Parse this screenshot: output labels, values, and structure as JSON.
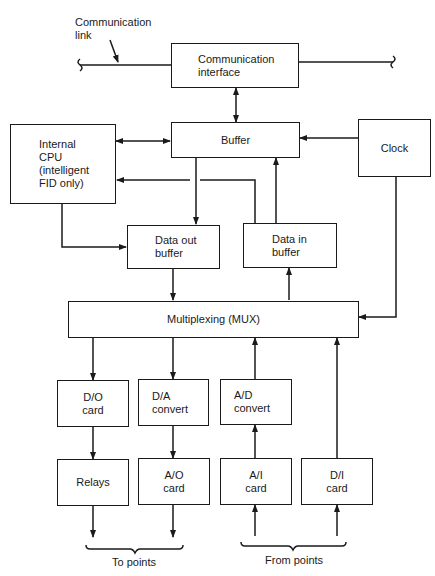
{
  "labels": {
    "communication_link": [
      "Communication",
      "link"
    ],
    "to_points": "To points",
    "from_points": "From points"
  },
  "blocks": {
    "comm_interface": [
      "Communication",
      "interface"
    ],
    "buffer": [
      "Buffer"
    ],
    "cpu": [
      "Internal",
      "CPU",
      "(intelligent",
      "FID only)"
    ],
    "clock": [
      "Clock"
    ],
    "data_out_buffer": [
      "Data out",
      "buffer"
    ],
    "data_in_buffer": [
      "Data in",
      "buffer"
    ],
    "mux": [
      "Multiplexing (MUX)"
    ],
    "do_card": [
      "D/O",
      "card"
    ],
    "da_convert": [
      "D/A",
      "convert"
    ],
    "ad_convert": [
      "A/D",
      "convert"
    ],
    "relays": [
      "Relays"
    ],
    "ao_card": [
      "A/O",
      "card"
    ],
    "ai_card": [
      "A/I",
      "card"
    ],
    "di_card": [
      "D/I",
      "card"
    ]
  },
  "colors": {
    "ink": "#1a1a1a",
    "background": "#ffffff"
  }
}
